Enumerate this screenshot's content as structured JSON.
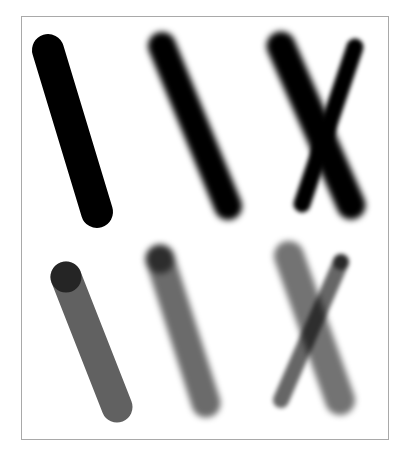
{
  "illustration": {
    "description": "Brush stroke comparison: hard vs soft edges, opaque vs semi-transparent, single vs crossed strokes",
    "background": "#ffffff",
    "frame": {
      "x": 21,
      "y": 16,
      "width": 368,
      "height": 424,
      "color": "#a9a9a9"
    },
    "rows": [
      {
        "name": "opaque",
        "strokes": [
          {
            "id": "opaque-hard",
            "x1": 48,
            "y1": 50,
            "x2": 97,
            "y2": 212,
            "width": 32,
            "color": "#000000",
            "opacity": 1.0,
            "blur": 0
          },
          {
            "id": "opaque-soft",
            "x1": 162,
            "y1": 46,
            "x2": 228,
            "y2": 206,
            "width": 28,
            "color": "#000000",
            "opacity": 1.0,
            "blur": 3
          },
          {
            "id": "opaque-cross-thick",
            "x1": 281,
            "y1": 46,
            "x2": 351,
            "y2": 205,
            "width": 29,
            "color": "#000000",
            "opacity": 1.0,
            "blur": 3
          },
          {
            "id": "opaque-cross-thin",
            "x1": 355,
            "y1": 47,
            "x2": 302,
            "y2": 204,
            "width": 17,
            "color": "#000000",
            "opacity": 1.0,
            "blur": 2
          }
        ]
      },
      {
        "name": "transparent",
        "strokes": [
          {
            "id": "transparent-hard",
            "x1": 66,
            "y1": 277,
            "x2": 117,
            "y2": 407,
            "width": 31,
            "color": "#000000",
            "opacity": 0.62,
            "blur": 0,
            "cap_dark": true
          },
          {
            "id": "transparent-soft",
            "x1": 160,
            "y1": 259,
            "x2": 206,
            "y2": 403,
            "width": 29,
            "color": "#000000",
            "opacity": 0.58,
            "blur": 3,
            "cap_dark": true
          },
          {
            "id": "transparent-cross-thick",
            "x1": 289,
            "y1": 256,
            "x2": 340,
            "y2": 400,
            "width": 30,
            "color": "#000000",
            "opacity": 0.55,
            "blur": 3,
            "cap_dark": false
          },
          {
            "id": "transparent-cross-thin",
            "x1": 341,
            "y1": 262,
            "x2": 281,
            "y2": 400,
            "width": 16,
            "color": "#000000",
            "opacity": 0.6,
            "blur": 2,
            "cap_dark": true
          }
        ]
      }
    ]
  }
}
